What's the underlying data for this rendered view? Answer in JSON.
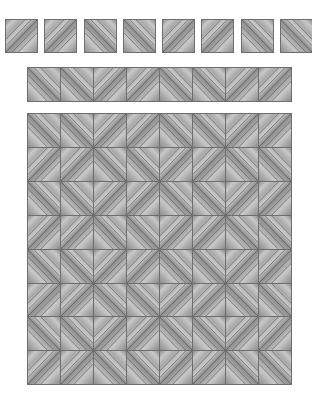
{
  "figure": {
    "colors": {
      "background": "#ffffff",
      "tile_base": "#a9a9a9",
      "tile_light": "#c8c8c8",
      "tile_dark": "#8e8e8e",
      "line": "#4a4a4a",
      "border": "#6e6e6e"
    },
    "lines_per_tile": 5
  },
  "loose_tiles": {
    "y": 19,
    "size": 33,
    "x_positions": [
      5,
      44,
      84,
      123,
      162,
      201,
      241,
      280
    ],
    "directions": [
      "/",
      "/",
      "\\",
      "\\",
      "/",
      "/",
      "\\",
      "\\"
    ]
  },
  "strip": {
    "x": 27,
    "y": 67,
    "cell": 33,
    "directions": [
      "\\",
      "\\",
      "/",
      "/",
      "\\",
      "\\",
      "/",
      "/"
    ]
  },
  "grid": {
    "x": 27,
    "y": 113,
    "cell_w": 33,
    "cell_h": 33.9,
    "rows": [
      [
        "\\",
        "\\",
        "/",
        "/",
        "\\",
        "\\",
        "/",
        "/"
      ],
      [
        "/",
        "/",
        "\\",
        "\\",
        "/",
        "/",
        "\\",
        "\\"
      ],
      [
        "\\",
        "\\",
        "/",
        "/",
        "\\",
        "\\",
        "/",
        "/"
      ],
      [
        "/",
        "/",
        "\\",
        "\\",
        "/",
        "/",
        "\\",
        "\\"
      ],
      [
        "\\",
        "\\",
        "/",
        "/",
        "\\",
        "\\",
        "/",
        "/"
      ],
      [
        "/",
        "/",
        "\\",
        "\\",
        "/",
        "/",
        "\\",
        "\\"
      ],
      [
        "\\",
        "\\",
        "/",
        "/",
        "\\",
        "\\",
        "/",
        "/"
      ],
      [
        "/",
        "/",
        "\\",
        "\\",
        "/",
        "/",
        "\\",
        "\\"
      ]
    ]
  }
}
